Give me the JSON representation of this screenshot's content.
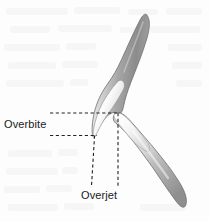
{
  "figure": {
    "background_color": "#fdfdfd"
  },
  "labels": {
    "overbite": "Overbite",
    "overjet": "Overjet"
  },
  "colors": {
    "text": "#1a1a1a",
    "dashed_line": "#222222",
    "root_dark": "#8e8e8e",
    "root_mid": "#b4b4b4",
    "crown_light": "#fbfbfb",
    "outline": "#6f6f6f"
  },
  "anatomy": {
    "upper_tooth": {
      "name": "upper-incisor",
      "root_tip": [
        148,
        14
      ],
      "crown_tip": [
        95,
        136
      ],
      "contact_point": [
        118,
        113
      ]
    },
    "lower_tooth": {
      "name": "lower-incisor",
      "crown_tip": [
        118,
        113
      ],
      "root_tip": [
        186,
        206
      ]
    }
  },
  "measurements": {
    "overbite": {
      "type": "horizontal-dashed-pair",
      "upper_line_y": 113,
      "lower_line_y": 135,
      "x_start": 50,
      "x_end": 120
    },
    "overjet": {
      "type": "vertical-dashed-pair",
      "left_line_x": 95,
      "right_line_x": 118,
      "y_start": 113,
      "y_end": 186
    }
  }
}
